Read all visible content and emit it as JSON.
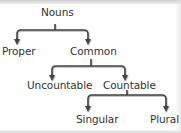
{
  "diagram": {
    "type": "tree",
    "colors": {
      "background": "#ffffff",
      "text": "#333333",
      "connector": "#444444"
    },
    "nodes": {
      "root": {
        "label": "Nouns"
      },
      "proper": {
        "label": "Proper"
      },
      "common": {
        "label": "Common"
      },
      "uncountable": {
        "label": "Uncountable"
      },
      "countable": {
        "label": "Countable"
      },
      "singular": {
        "label": "Singular"
      },
      "plural": {
        "label": "Plural"
      }
    },
    "edges": [
      {
        "from": "Nouns",
        "to": "Proper"
      },
      {
        "from": "Nouns",
        "to": "Common"
      },
      {
        "from": "Common",
        "to": "Uncountable"
      },
      {
        "from": "Common",
        "to": "Countable"
      },
      {
        "from": "Countable",
        "to": "Singular"
      },
      {
        "from": "Countable",
        "to": "Plural"
      }
    ]
  }
}
